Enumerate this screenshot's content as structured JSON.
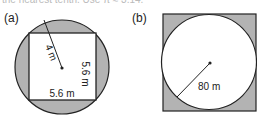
{
  "top_text": "the nearest tenth. Use π ≈ 3.14.",
  "figures": [
    {
      "label": "(a)",
      "shape": "square inscribed in circle",
      "radius_label": "4 m",
      "side_right_label": "5.6 m",
      "side_bottom_label": "5.6 m",
      "shaded": "circle region outside square"
    },
    {
      "label": "(b)",
      "shape": "circle inscribed in square",
      "radius_label": "80 m",
      "shaded": "square region outside circle"
    }
  ],
  "colors": {
    "shade": "#b3b3b3",
    "stroke": "#222222",
    "fill": "#ffffff"
  }
}
